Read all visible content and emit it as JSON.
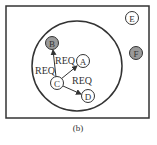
{
  "caption": "(b)",
  "colors": {
    "line": "#333333",
    "shaded": "#9a9a9a",
    "fill": "#ffffff"
  },
  "nodes": [
    {
      "id": "A",
      "label": "A",
      "shaded": false
    },
    {
      "id": "B",
      "label": "B",
      "shaded": true
    },
    {
      "id": "C",
      "label": "C",
      "shaded": false
    },
    {
      "id": "D",
      "label": "D",
      "shaded": false
    },
    {
      "id": "E",
      "label": "E",
      "shaded": false
    },
    {
      "id": "F",
      "label": "F",
      "shaded": true
    }
  ],
  "edges": [
    {
      "from": "C",
      "to": "B",
      "label": "REQ"
    },
    {
      "from": "C",
      "to": "A",
      "label": "REQ"
    },
    {
      "from": "C",
      "to": "D",
      "label": "REQ"
    }
  ]
}
